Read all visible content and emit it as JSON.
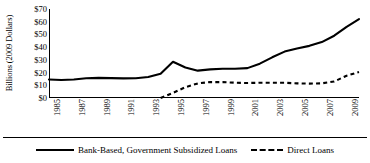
{
  "chart_data": {
    "type": "line",
    "title": "",
    "xlabel": "",
    "ylabel": "Billions (2009 Dollars)",
    "xlim": [
      1985,
      2010
    ],
    "ylim": [
      0,
      70
    ],
    "grid": false,
    "legend_position": "bottom",
    "ytick_labels": [
      "$70",
      "$60",
      "$50",
      "$40",
      "$30",
      "$20",
      "$10",
      "$0"
    ],
    "ytick_values": [
      70,
      60,
      50,
      40,
      30,
      20,
      10,
      0
    ],
    "xtick_labels": [
      "1985",
      "1987",
      "1989",
      "1991",
      "1993",
      "1995",
      "1997",
      "1999",
      "2001",
      "2003",
      "2005",
      "2007",
      "2009"
    ],
    "xtick_values": [
      1985,
      1987,
      1989,
      1991,
      1993,
      1995,
      1997,
      1999,
      2001,
      2003,
      2005,
      2007,
      2009
    ],
    "x": [
      1985,
      1986,
      1987,
      1988,
      1989,
      1990,
      1991,
      1992,
      1993,
      1994,
      1995,
      1996,
      1997,
      1998,
      1999,
      2000,
      2001,
      2002,
      2003,
      2004,
      2005,
      2006,
      2007,
      2008,
      2009,
      2010
    ],
    "series": [
      {
        "name": "Bank-Based, Government Subsidized Loans",
        "style": "solid",
        "color": "#000000",
        "values": [
          14.5,
          14.2,
          14.6,
          15.5,
          15.8,
          15.6,
          15.4,
          15.5,
          16.5,
          19.0,
          28.5,
          24.0,
          21.5,
          22.5,
          23.0,
          23.0,
          23.5,
          27.0,
          32.0,
          36.5,
          39.0,
          41.0,
          44.0,
          49.0,
          56.0,
          62.0
        ]
      },
      {
        "name": "Direct Loans",
        "style": "dashed",
        "color": "#000000",
        "values": [
          null,
          null,
          null,
          null,
          null,
          null,
          null,
          null,
          null,
          0.0,
          4.0,
          8.5,
          11.5,
          12.5,
          12.5,
          12.0,
          11.8,
          12.0,
          12.0,
          12.0,
          11.5,
          11.3,
          11.5,
          13.0,
          17.5,
          20.5
        ]
      }
    ]
  },
  "legend": {
    "items": [
      {
        "label": "Bank-Based, Government Subsidized Loans",
        "style": "solid"
      },
      {
        "label": "Direct Loans",
        "style": "dashed"
      }
    ]
  }
}
